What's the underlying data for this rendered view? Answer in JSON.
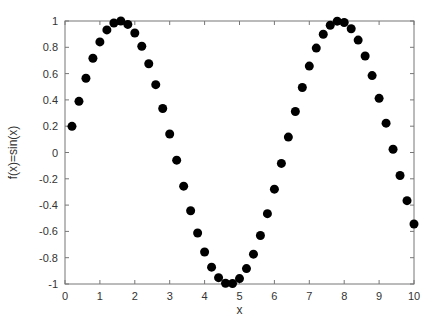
{
  "chart_data": {
    "type": "scatter",
    "title": "",
    "xlabel": "x",
    "ylabel": "f(x)=sin(x)",
    "xlim": [
      0,
      10
    ],
    "ylim": [
      -1,
      1
    ],
    "grid": false,
    "legend": null,
    "x_ticks": [
      0,
      1,
      2,
      3,
      4,
      5,
      6,
      7,
      8,
      9,
      10
    ],
    "y_ticks": [
      -1,
      -0.8,
      -0.6,
      -0.4,
      -0.2,
      0,
      0.2,
      0.4,
      0.6,
      0.8,
      1
    ],
    "x_tick_labels": [
      "0",
      "1",
      "2",
      "3",
      "4",
      "5",
      "6",
      "7",
      "8",
      "9",
      "10"
    ],
    "y_tick_labels": [
      "-1",
      "-0.8",
      "-0.6",
      "-0.4",
      "-0.2",
      "0",
      "0.2",
      "0.4",
      "0.6",
      "0.8",
      "1"
    ],
    "series": [
      {
        "name": "sin(x)",
        "marker": "filled-circle",
        "color": "#000000",
        "x": [
          0.2,
          0.4,
          0.6,
          0.8,
          1.0,
          1.2,
          1.4,
          1.6,
          1.8,
          2.0,
          2.2,
          2.4,
          2.6,
          2.8,
          3.0,
          3.2,
          3.4,
          3.6,
          3.8,
          4.0,
          4.2,
          4.4,
          4.6,
          4.8,
          5.0,
          5.2,
          5.4,
          5.6,
          5.8,
          6.0,
          6.2,
          6.4,
          6.6,
          6.8,
          7.0,
          7.2,
          7.4,
          7.6,
          7.8,
          8.0,
          8.2,
          8.4,
          8.6,
          8.8,
          9.0,
          9.2,
          9.4,
          9.6,
          9.8,
          10.0
        ],
        "y": [
          0.199,
          0.389,
          0.565,
          0.717,
          0.841,
          0.932,
          0.985,
          1.0,
          0.974,
          0.909,
          0.808,
          0.675,
          0.516,
          0.335,
          0.141,
          -0.058,
          -0.256,
          -0.443,
          -0.612,
          -0.757,
          -0.872,
          -0.952,
          -0.994,
          -0.996,
          -0.959,
          -0.883,
          -0.773,
          -0.631,
          -0.465,
          -0.279,
          -0.083,
          0.117,
          0.312,
          0.494,
          0.657,
          0.794,
          0.899,
          0.968,
          0.999,
          0.989,
          0.941,
          0.855,
          0.734,
          0.585,
          0.412,
          0.223,
          0.025,
          -0.175,
          -0.366,
          -0.544
        ]
      }
    ]
  },
  "colors": {
    "axis": "#777777",
    "marker": "#000000",
    "text": "#333333",
    "background": "#ffffff"
  }
}
